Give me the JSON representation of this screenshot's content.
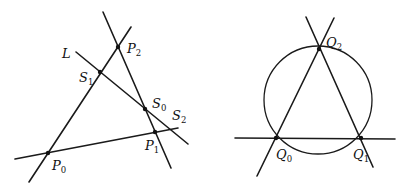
{
  "figures": {
    "left": {
      "title": "Triangle P0P1P2 cut by line L",
      "lines": [
        {
          "id": "line-p0-p2",
          "x1": 29,
          "y1": 182,
          "x2": 131,
          "y2": 27
        },
        {
          "id": "line-p2-p1",
          "x1": 103,
          "y1": 12,
          "x2": 171,
          "y2": 168
        },
        {
          "id": "line-p0-p1",
          "x1": 15,
          "y1": 159,
          "x2": 178,
          "y2": 128
        },
        {
          "id": "line-L",
          "x1": 76,
          "y1": 52,
          "x2": 188,
          "y2": 144
        }
      ],
      "points": [
        {
          "id": "P2",
          "x": 118,
          "y": 47
        },
        {
          "id": "S1",
          "x": 100,
          "y": 72
        },
        {
          "id": "S0",
          "x": 145,
          "y": 109
        },
        {
          "id": "P1",
          "x": 155,
          "y": 132
        },
        {
          "id": "P0",
          "x": 48,
          "y": 153
        },
        {
          "id": "S2",
          "x": 172,
          "y": 129
        }
      ],
      "labels": {
        "L": {
          "main": "L",
          "sub": ""
        },
        "P2": {
          "main": "P",
          "sub": "2"
        },
        "S1": {
          "main": "S",
          "sub": "1"
        },
        "S0": {
          "main": "S",
          "sub": "0"
        },
        "S2": {
          "main": "S",
          "sub": "2"
        },
        "P1": {
          "main": "P",
          "sub": "1"
        },
        "P0": {
          "main": "P",
          "sub": "0"
        }
      }
    },
    "right": {
      "title": "Triangle Q0Q1Q2 inscribed in circle",
      "circle": {
        "cx": 318,
        "cy": 100,
        "r": 54
      },
      "lines": [
        {
          "id": "line-q0-q2",
          "x1": 257,
          "y1": 176,
          "x2": 334,
          "y2": 18
        },
        {
          "id": "line-q2-q1",
          "x1": 306,
          "y1": 17,
          "x2": 373,
          "y2": 167
        },
        {
          "id": "line-q0-q1",
          "x1": 235,
          "y1": 138,
          "x2": 395,
          "y2": 139
        }
      ],
      "points": [
        {
          "id": "Q2",
          "x": 319,
          "y": 49
        },
        {
          "id": "Q0",
          "x": 276,
          "y": 138
        },
        {
          "id": "Q1",
          "x": 361,
          "y": 138
        }
      ],
      "labels": {
        "Q2": {
          "main": "Q",
          "sub": "2"
        },
        "Q0": {
          "main": "Q",
          "sub": "0"
        },
        "Q1": {
          "main": "Q",
          "sub": "1"
        }
      }
    }
  }
}
